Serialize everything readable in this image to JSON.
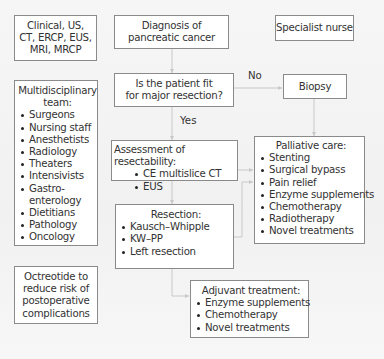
{
  "diagram": {
    "colors": {
      "background": "#f4f4f4",
      "box_fill": "#ffffff",
      "box_border": "#8a8a8a",
      "connector": "#c8c8c8",
      "text": "#333333"
    },
    "clinical_box": {
      "lines": [
        "Clinical, US,",
        "CT, ERCP, EUS,",
        "MRI, MRCP"
      ]
    },
    "diagnosis_box": {
      "lines": [
        "Diagnosis of",
        "pancreatic cancer"
      ]
    },
    "specialist_box": {
      "label": "Specialist nurse"
    },
    "fit_box": {
      "lines": [
        "Is the patient fit",
        "for major resection?"
      ]
    },
    "biopsy_box": {
      "label": "Biopsy"
    },
    "edge_labels": {
      "no": "No",
      "yes": "Yes"
    },
    "team_box": {
      "title_lines": [
        "Multidisciplinary",
        "team:"
      ],
      "items": [
        "Surgeons",
        "Nursing staff",
        "Anesthetists",
        "Radiology",
        "Theaters",
        "Intensivists",
        "Gastro-",
        "enterology",
        "Dietitians",
        "Pathology",
        "Oncology"
      ]
    },
    "assessment_box": {
      "title": "Assessment of resectability:",
      "items": [
        "CE multislice CT",
        "EUS"
      ]
    },
    "palliative_box": {
      "title": "Palliative care:",
      "items": [
        "Stenting",
        "Surgical bypass",
        "Pain relief",
        "Enzyme supplements",
        "Chemotherapy",
        "Radiotherapy",
        "Novel treatments"
      ]
    },
    "resection_box": {
      "title": "Resection:",
      "items": [
        "Kausch–Whipple",
        "KW–PP",
        "Left resection"
      ]
    },
    "octreotide_box": {
      "lines": [
        "Octreotide to",
        "reduce risk of",
        "postoperative",
        "complications"
      ]
    },
    "adjuvant_box": {
      "title": "Adjuvant treatment:",
      "items": [
        "Enzyme supplements",
        "Chemotherapy",
        "Novel treatments"
      ]
    }
  }
}
